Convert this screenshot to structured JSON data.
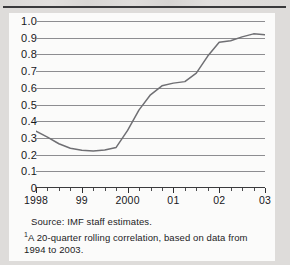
{
  "figure": {
    "source_note": "Source: IMF staff estimates.",
    "footnote_marker": "1",
    "footnote_text": "A 20-quarter rolling correlation, based on data from 1994 to 2003."
  },
  "chart_data": {
    "type": "line",
    "title": "",
    "xlabel": "",
    "ylabel": "",
    "ylim": [
      0,
      1.0
    ],
    "ytick_labels": [
      "1.0",
      "0.9",
      "0.8",
      "0.7",
      "0.6",
      "0.5",
      "0.4",
      "0.3",
      "0.2",
      "0.1",
      "0"
    ],
    "ytick_values": [
      1.0,
      0.9,
      0.8,
      0.7,
      0.6,
      0.5,
      0.4,
      0.3,
      0.2,
      0.1,
      0
    ],
    "grid": true,
    "legend": "none",
    "xtick_labels": [
      "1998",
      "99",
      "2000",
      "01",
      "02",
      "03"
    ],
    "xtick_values": [
      1998,
      1999,
      2000,
      2001,
      2002,
      2003
    ],
    "x_minor_interval_quarters": 1,
    "xlim": [
      1998,
      2003
    ],
    "line_color": "#6f6f73",
    "x": [
      1998.0,
      1998.25,
      1998.5,
      1998.75,
      1999.0,
      1999.25,
      1999.5,
      1999.75,
      2000.0,
      2000.25,
      2000.5,
      2000.75,
      2001.0,
      2001.25,
      2001.5,
      2001.75,
      2002.0,
      2002.25,
      2002.5,
      2002.75,
      2003.0
    ],
    "values": [
      0.34,
      0.31,
      0.27,
      0.24,
      0.225,
      0.222,
      0.228,
      0.24,
      0.35,
      0.5,
      0.57,
      0.62,
      0.635,
      0.655,
      0.72,
      0.8,
      0.875,
      0.885,
      0.9,
      0.92,
      0.925
    ],
    "values_tail_x": [
      2002.0,
      2002.25,
      2002.5,
      2002.75,
      2003.0
    ],
    "series": [
      {
        "name": "20-quarter rolling correlation",
        "points": [
          {
            "x": 1998.0,
            "y": 0.34
          },
          {
            "x": 1998.25,
            "y": 0.305
          },
          {
            "x": 1998.5,
            "y": 0.265
          },
          {
            "x": 1998.75,
            "y": 0.238
          },
          {
            "x": 1999.0,
            "y": 0.226
          },
          {
            "x": 1999.25,
            "y": 0.222
          },
          {
            "x": 1999.5,
            "y": 0.227
          },
          {
            "x": 1999.75,
            "y": 0.243
          },
          {
            "x": 2000.0,
            "y": 0.345
          },
          {
            "x": 2000.25,
            "y": 0.468
          },
          {
            "x": 2000.5,
            "y": 0.558
          },
          {
            "x": 2000.75,
            "y": 0.612
          },
          {
            "x": 2001.0,
            "y": 0.628
          },
          {
            "x": 2001.25,
            "y": 0.637
          },
          {
            "x": 2001.5,
            "y": 0.688
          },
          {
            "x": 2001.75,
            "y": 0.79
          },
          {
            "x": 2002.0,
            "y": 0.873
          },
          {
            "x": 2002.25,
            "y": 0.882
          },
          {
            "x": 2002.5,
            "y": 0.905
          },
          {
            "x": 2002.75,
            "y": 0.923
          },
          {
            "x": 2003.0,
            "y": 0.918
          }
        ]
      }
    ],
    "annotations": {
      "peak_value": 0.925,
      "trough_value": 0.222,
      "start_value": 0.34,
      "end_value": 0.785
    }
  }
}
